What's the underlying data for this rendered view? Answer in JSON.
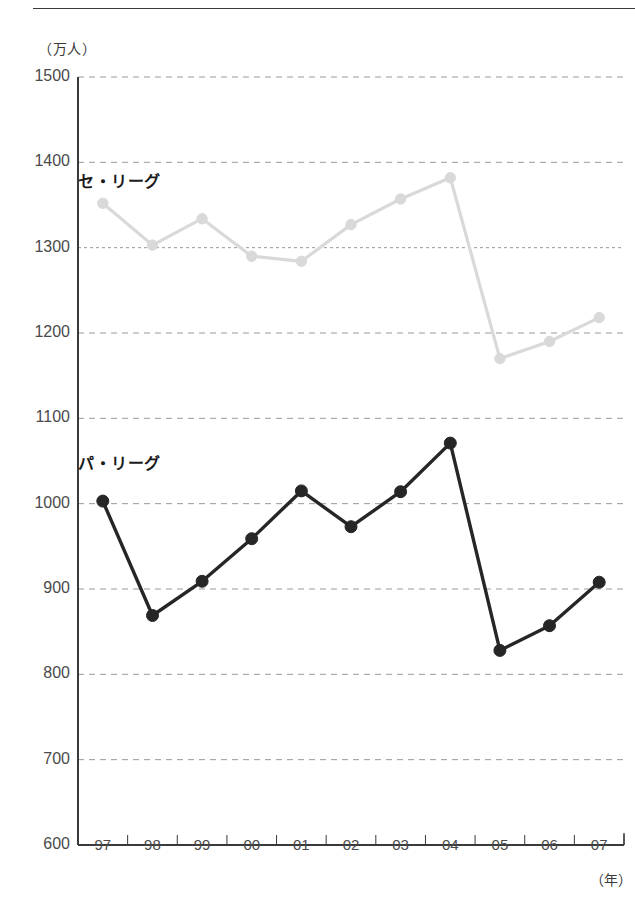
{
  "axis": {
    "unit_label": "（万人）",
    "year_label": "（年）"
  },
  "series_labels": {
    "central": "セ・リーグ",
    "pacific": "パ・リーグ"
  },
  "colors": {
    "central": "#d9d9d9",
    "pacific": "#262626",
    "grid": "#9a9a9a",
    "axis": "#3a3a3a",
    "text": "#4a4a4a"
  },
  "chart_data": {
    "type": "line",
    "title": "",
    "xlabel": "（年）",
    "ylabel": "（万人）",
    "categories": [
      "97",
      "98",
      "99",
      "00",
      "01",
      "02",
      "03",
      "04",
      "05",
      "06",
      "07"
    ],
    "ylim": [
      600,
      1500
    ],
    "yticks": [
      600,
      700,
      800,
      900,
      1000,
      1100,
      1200,
      1300,
      1400,
      1500
    ],
    "grid": true,
    "legend": "inline-labels",
    "series": [
      {
        "name": "セ・リーグ",
        "color": "#d9d9d9",
        "values": [
          1352,
          1303,
          1334,
          1290,
          1284,
          1327,
          1357,
          1382,
          1170,
          1190,
          1218
        ]
      },
      {
        "name": "パ・リーグ",
        "color": "#262626",
        "values": [
          1003,
          869,
          909,
          959,
          1015,
          973,
          1014,
          1071,
          828,
          857,
          908
        ]
      }
    ]
  }
}
